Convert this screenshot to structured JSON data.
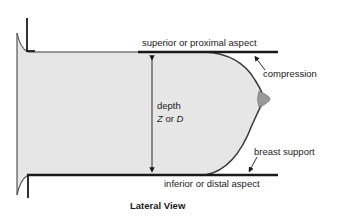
{
  "diagram": {
    "caption": "Lateral View",
    "labels": {
      "superior": "superior or proximal aspect",
      "compression": "compression",
      "depth": "depth",
      "depth_symbol_z": "Z",
      "depth_symbol_or": " or ",
      "depth_symbol_d": "D",
      "breast_support": "breast support",
      "inferior": "inferior or distal aspect"
    },
    "colors": {
      "breast_fill": "#e6e6e6",
      "nipple_fill": "#9a9a9a",
      "outline": "#3a3a3a",
      "plate": "#1a1a1a",
      "text": "#1a1a1a"
    }
  }
}
